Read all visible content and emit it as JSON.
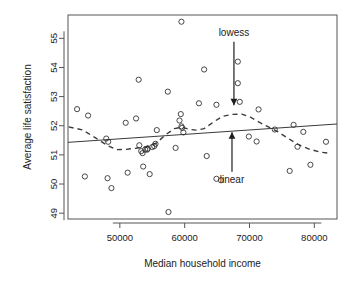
{
  "chart_data": {
    "type": "scatter",
    "title": "",
    "xlabel": "Median household income",
    "ylabel": "Average life satisfaction",
    "xlim": [
      42000,
      83500
    ],
    "ylim": [
      48.8,
      55.8
    ],
    "xticks": [
      50000,
      60000,
      70000,
      80000
    ],
    "xtick_labels": [
      "50000",
      "60000",
      "70000",
      "80000"
    ],
    "yticks": [
      49,
      50,
      51,
      52,
      53,
      54,
      55
    ],
    "ytick_labels": [
      "49",
      "50",
      "51",
      "52",
      "53",
      "54",
      "55"
    ],
    "grid": false,
    "legend": "none",
    "point_marker": "open-circle",
    "points": [
      {
        "x": 43400,
        "y": 52.57
      },
      {
        "x": 45100,
        "y": 52.35
      },
      {
        "x": 44600,
        "y": 50.26
      },
      {
        "x": 47900,
        "y": 51.56
      },
      {
        "x": 48200,
        "y": 51.45
      },
      {
        "x": 48100,
        "y": 50.2
      },
      {
        "x": 48700,
        "y": 49.86
      },
      {
        "x": 50900,
        "y": 52.1
      },
      {
        "x": 51200,
        "y": 50.39
      },
      {
        "x": 52500,
        "y": 52.25
      },
      {
        "x": 52900,
        "y": 53.58
      },
      {
        "x": 53000,
        "y": 51.33
      },
      {
        "x": 53300,
        "y": 51.13
      },
      {
        "x": 53500,
        "y": 51.06
      },
      {
        "x": 53600,
        "y": 50.6
      },
      {
        "x": 53900,
        "y": 51.18
      },
      {
        "x": 54200,
        "y": 51.18
      },
      {
        "x": 54300,
        "y": 51.21
      },
      {
        "x": 54600,
        "y": 50.34
      },
      {
        "x": 55000,
        "y": 51.27
      },
      {
        "x": 55300,
        "y": 51.3
      },
      {
        "x": 55500,
        "y": 51.38
      },
      {
        "x": 55700,
        "y": 51.85
      },
      {
        "x": 57400,
        "y": 53.17
      },
      {
        "x": 57500,
        "y": 49.04
      },
      {
        "x": 58600,
        "y": 51.24
      },
      {
        "x": 59200,
        "y": 52.18
      },
      {
        "x": 59400,
        "y": 52.4
      },
      {
        "x": 59500,
        "y": 51.98
      },
      {
        "x": 59600,
        "y": 51.93
      },
      {
        "x": 59500,
        "y": 55.57
      },
      {
        "x": 59800,
        "y": 51.77
      },
      {
        "x": 62200,
        "y": 52.77
      },
      {
        "x": 63000,
        "y": 53.93
      },
      {
        "x": 63400,
        "y": 50.96
      },
      {
        "x": 64900,
        "y": 50.18
      },
      {
        "x": 64900,
        "y": 52.72
      },
      {
        "x": 65600,
        "y": 50.13
      },
      {
        "x": 68200,
        "y": 54.2
      },
      {
        "x": 68200,
        "y": 53.46
      },
      {
        "x": 68500,
        "y": 52.82
      },
      {
        "x": 69900,
        "y": 51.63
      },
      {
        "x": 71100,
        "y": 51.46
      },
      {
        "x": 71400,
        "y": 52.56
      },
      {
        "x": 73900,
        "y": 51.87
      },
      {
        "x": 76200,
        "y": 50.45
      },
      {
        "x": 76800,
        "y": 52.03
      },
      {
        "x": 77400,
        "y": 51.28
      },
      {
        "x": 78300,
        "y": 51.79
      },
      {
        "x": 79400,
        "y": 50.66
      },
      {
        "x": 81800,
        "y": 51.45
      }
    ],
    "series": [
      {
        "name": "linear",
        "type": "line",
        "style": "solid",
        "points": [
          {
            "x": 42000,
            "y": 51.43
          },
          {
            "x": 83500,
            "y": 52.06
          }
        ]
      },
      {
        "name": "lowess",
        "type": "line",
        "style": "dashed",
        "points": [
          {
            "x": 42100,
            "y": 51.96
          },
          {
            "x": 44200,
            "y": 51.86
          },
          {
            "x": 46000,
            "y": 51.62
          },
          {
            "x": 48000,
            "y": 51.33
          },
          {
            "x": 49500,
            "y": 51.18
          },
          {
            "x": 51000,
            "y": 51.19
          },
          {
            "x": 52500,
            "y": 51.23
          },
          {
            "x": 54000,
            "y": 51.28
          },
          {
            "x": 55600,
            "y": 51.4
          },
          {
            "x": 57000,
            "y": 51.68
          },
          {
            "x": 58400,
            "y": 51.9
          },
          {
            "x": 59600,
            "y": 51.95
          },
          {
            "x": 60600,
            "y": 51.88
          },
          {
            "x": 61800,
            "y": 51.85
          },
          {
            "x": 63000,
            "y": 51.9
          },
          {
            "x": 64400,
            "y": 52.12
          },
          {
            "x": 65800,
            "y": 52.32
          },
          {
            "x": 67400,
            "y": 52.39
          },
          {
            "x": 68800,
            "y": 52.4
          },
          {
            "x": 70100,
            "y": 52.3
          },
          {
            "x": 71500,
            "y": 52.12
          },
          {
            "x": 73000,
            "y": 51.95
          },
          {
            "x": 74400,
            "y": 51.79
          },
          {
            "x": 76000,
            "y": 51.56
          },
          {
            "x": 77500,
            "y": 51.36
          },
          {
            "x": 79200,
            "y": 51.2
          },
          {
            "x": 80800,
            "y": 51.1
          },
          {
            "x": 82200,
            "y": 51.06
          }
        ]
      }
    ],
    "annotations": [
      {
        "label": "lowess",
        "label_x": 67600,
        "label_y": 55.18,
        "arrow_from": {
          "x": 67600,
          "y": 54.88
        },
        "arrow_to": {
          "x": 67600,
          "y": 52.7
        },
        "direction": "down"
      },
      {
        "label": "linear",
        "label_x": 67300,
        "label_y": 50.15,
        "arrow_from": {
          "x": 67300,
          "y": 50.42
        },
        "arrow_to": {
          "x": 67300,
          "y": 51.78
        },
        "direction": "up"
      }
    ]
  }
}
